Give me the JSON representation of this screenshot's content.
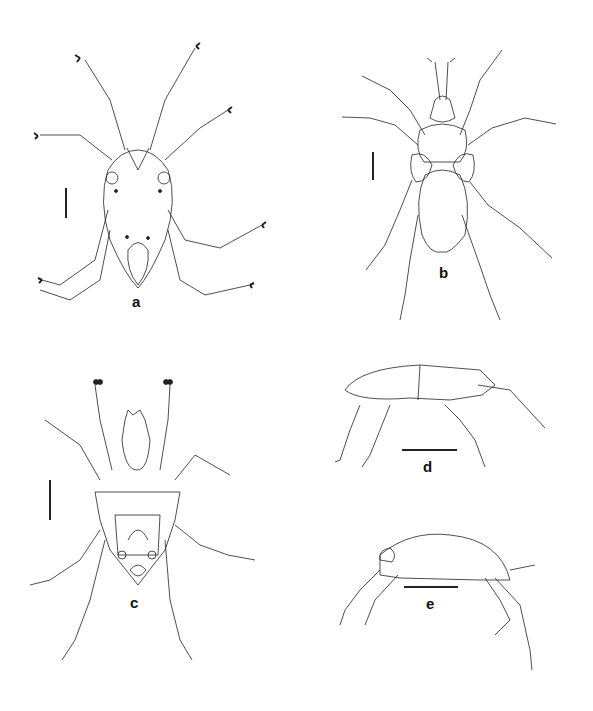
{
  "figure": {
    "type": "scientific-illustration-plate",
    "panels": [
      {
        "id": "a",
        "label": "a",
        "view": "dorsal",
        "scale_bar": "vertical"
      },
      {
        "id": "b",
        "label": "b",
        "view": "dorsal",
        "scale_bar": "vertical"
      },
      {
        "id": "c",
        "label": "c",
        "view": "ventral",
        "scale_bar": "vertical"
      },
      {
        "id": "d",
        "label": "d",
        "view": "lateral",
        "scale_bar": "horizontal"
      },
      {
        "id": "e",
        "label": "e",
        "view": "lateral",
        "scale_bar": "horizontal"
      }
    ],
    "colors": {
      "ink": "#222222",
      "background": "#ffffff"
    }
  }
}
